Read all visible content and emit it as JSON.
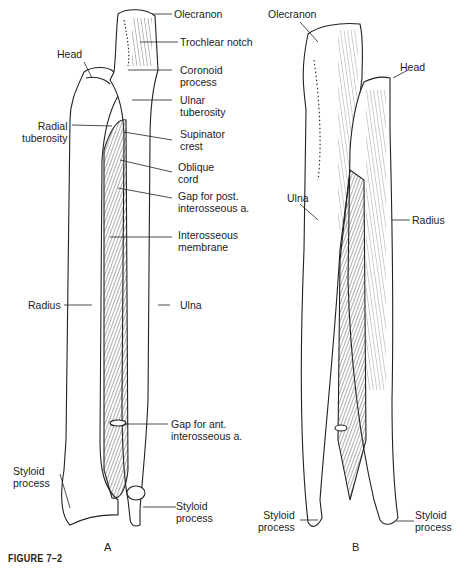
{
  "figure": {
    "caption": "FIGURE 7–2",
    "panels": [
      {
        "id": "A",
        "letter": "A",
        "view": "anterior",
        "labels": [
          {
            "text": "Olecranon"
          },
          {
            "text": "Trochlear notch"
          },
          {
            "text": "Head"
          },
          {
            "text": "Coronoid process",
            "lines": [
              "Coronoid",
              "process"
            ]
          },
          {
            "text": "Ulnar tuberosity",
            "lines": [
              "Ulnar",
              "tuberosity"
            ]
          },
          {
            "text": "Radial tuberosity",
            "lines": [
              "Radial",
              "tuberosity"
            ]
          },
          {
            "text": "Supinator crest",
            "lines": [
              "Supinator",
              "crest"
            ]
          },
          {
            "text": "Oblique cord",
            "lines": [
              "Oblique",
              "cord"
            ]
          },
          {
            "text": "Gap for post. interosseous a.",
            "lines": [
              "Gap for post.",
              "interosseous a."
            ]
          },
          {
            "text": "Interosseous membrane",
            "lines": [
              "Interosseous",
              "membrane"
            ]
          },
          {
            "text": "Radius"
          },
          {
            "text": "Ulna"
          },
          {
            "text": "Gap for ant. interosseous a.",
            "lines": [
              "Gap for ant.",
              "interosseous a."
            ]
          },
          {
            "text": "Styloid process (radius)",
            "lines": [
              "Styloid",
              "process"
            ]
          },
          {
            "text": "Styloid process (ulna)",
            "lines": [
              "Styloid",
              "process"
            ]
          }
        ]
      },
      {
        "id": "B",
        "letter": "B",
        "view": "posterior",
        "labels": [
          {
            "text": "Olecranon"
          },
          {
            "text": "Head"
          },
          {
            "text": "Ulna"
          },
          {
            "text": "Radius"
          },
          {
            "text": "Styloid process (ulna)",
            "lines": [
              "Styloid",
              "process"
            ]
          },
          {
            "text": "Styloid process (radius)",
            "lines": [
              "Styloid",
              "process"
            ]
          }
        ]
      }
    ]
  }
}
